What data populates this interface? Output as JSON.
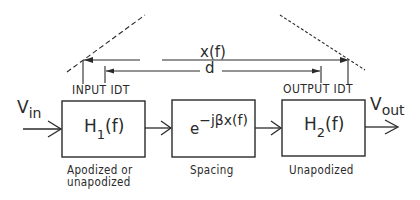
{
  "diagram": {
    "input_signal": {
      "base": "V",
      "subscript": "in"
    },
    "output_signal": {
      "base": "V",
      "subscript": "out"
    },
    "dimensions": {
      "outer_label": "x(f)",
      "inner_label": "d"
    },
    "transducer_labels": {
      "input": "INPUT IDT",
      "output": "OUTPUT IDT"
    },
    "blocks": [
      {
        "id": "h1",
        "base": "H",
        "subscript": "1",
        "suffix": "(f)",
        "caption_line1": "Apodized or",
        "caption_line2": "unapodized"
      },
      {
        "id": "spacing",
        "base": "e",
        "superscript": "−jβx(f)",
        "caption_line1": "Spacing"
      },
      {
        "id": "h2",
        "base": "H",
        "subscript": "2",
        "suffix": "(f)",
        "caption_line1": "Unapodized"
      }
    ],
    "colors": {
      "line": "#2a2a2a",
      "background": "#ffffff"
    }
  }
}
